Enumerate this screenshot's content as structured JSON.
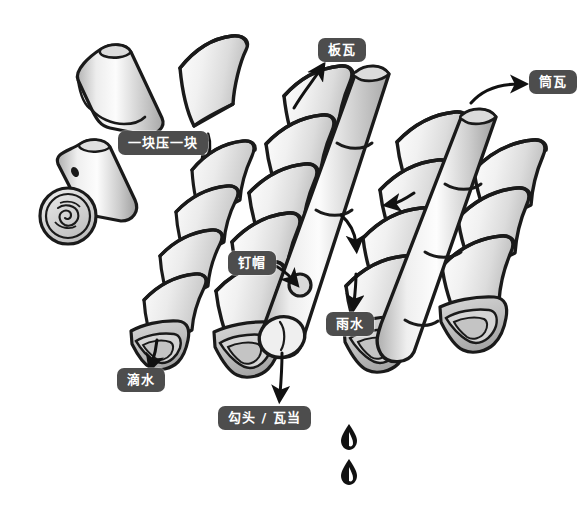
{
  "figure": {
    "background_color": "#ffffff",
    "ink_color": "#1a1a1a",
    "label_pill_color": "#4d4d4d",
    "label_text_color": "#ffffff",
    "tile_fill_light": "#fafafa",
    "tile_fill_mid": "#e2e2e2",
    "tile_fill_dark": "#c2c2c2",
    "tile_fill_shadow": "#a9a9a9"
  },
  "labels": [
    {
      "id": "ban-wa",
      "text": "板瓦",
      "x": 318,
      "y": 38,
      "role": "flat-tile-callout"
    },
    {
      "id": "tong-wa",
      "text": "筒瓦",
      "x": 529,
      "y": 70,
      "role": "barrel-tile-callout"
    },
    {
      "id": "yi-kuai-ya-yi-kuai",
      "text": "一块压一块",
      "x": 118,
      "y": 131,
      "role": "overlap-callout"
    },
    {
      "id": "ding-mao",
      "text": "钉帽",
      "x": 228,
      "y": 251,
      "role": "nail-cap-callout"
    },
    {
      "id": "yu-shui",
      "text": "雨水",
      "x": 326,
      "y": 312,
      "role": "rainwater-callout"
    },
    {
      "id": "di-shui",
      "text": "滴水",
      "x": 117,
      "y": 368,
      "role": "drip-tile-callout"
    },
    {
      "id": "gou-tou-wa-dang",
      "text": "勾头 / 瓦当",
      "x": 218,
      "y": 406,
      "role": "eave-tile-callout"
    }
  ],
  "parts": {
    "loose_barrel_tile": "loose barrel tile piece, upper left",
    "loose_eave_tile": "loose eave tile with round decorative end, left",
    "loose_flat_tile": "loose flat tile floating above the stack",
    "flat_tile_columns": 3,
    "barrel_tile_ridges": 2,
    "water_drops": 2
  }
}
